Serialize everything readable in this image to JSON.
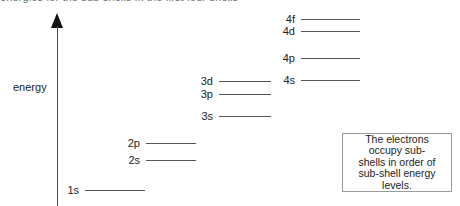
{
  "figure": {
    "title_partial": "energies for the sub-shells in the first four shells",
    "axis": {
      "label": "energy",
      "direction": "up",
      "arrow_icon": "up-arrow-icon"
    }
  },
  "chart_data": {
    "type": "diagram",
    "title": "energies for the sub-shells in the first four shells",
    "ylabel": "energy",
    "xlabel": "",
    "grid": false,
    "legend": null,
    "groups": [
      {
        "shell": 1,
        "label_x": 63,
        "line_x1": 85,
        "line_x2": 145,
        "levels": [
          {
            "label": "1s",
            "y": 190,
            "energy_rank": 1
          }
        ]
      },
      {
        "shell": 2,
        "label_x": 126,
        "line_x1": 146,
        "line_x2": 196,
        "levels": [
          {
            "label": "2p",
            "y": 143,
            "energy_rank": 3
          },
          {
            "label": "2s",
            "y": 160,
            "energy_rank": 2
          }
        ]
      },
      {
        "shell": 3,
        "label_x": 194,
        "line_x1": 219,
        "line_x2": 271,
        "levels": [
          {
            "label": "3d",
            "y": 81,
            "energy_rank": 6
          },
          {
            "label": "3p",
            "y": 94,
            "energy_rank": 5
          },
          {
            "label": "3s",
            "y": 116,
            "energy_rank": 4
          }
        ]
      },
      {
        "shell": 4,
        "label_x": 279,
        "line_x1": 301,
        "line_x2": 360,
        "levels": [
          {
            "label": "4f",
            "y": 19,
            "energy_rank": 10
          },
          {
            "label": "4d",
            "y": 31,
            "energy_rank": 9
          },
          {
            "label": "4p",
            "y": 58,
            "energy_rank": 8
          },
          {
            "label": "4s",
            "y": 80,
            "energy_rank": 7
          }
        ]
      }
    ]
  },
  "caption": {
    "lines": [
      "The electrons",
      "occupy sub-",
      "shells  in order of",
      "sub-shell energy",
      "levels."
    ],
    "full_text": "The electrons occupy sub-shells  in order of sub-shell energy levels."
  },
  "colors": {
    "line": "#555555",
    "axis": "#4a4a4a",
    "arrow": "#111111",
    "text": "#222222",
    "box_border": "#9a9a9a",
    "background": "#ffffff"
  }
}
